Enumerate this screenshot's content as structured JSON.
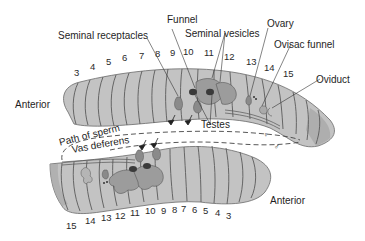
{
  "colors": {
    "body_fill": "#c3c3c3",
    "body_shade": "#a9a9a9",
    "segment_line": "#5a5a5a",
    "organ_fill": "#9c9c9c",
    "organ_dark": "#3a3a3a",
    "text": "#1e1e1e",
    "background": "#ffffff"
  },
  "labels": {
    "funnel": "Funnel",
    "seminal_receptacles": "Seminal receptacles",
    "seminal_vesicles": "Seminal vesicles",
    "ovary": "Ovary",
    "ovisac_funnel": "Ovisac funnel",
    "oviduct": "Oviduct",
    "testes": "Testes",
    "path_of_sperm": "Path of sperm",
    "vas_deferens": "Vas deferens",
    "anterior_top": "Anterior",
    "anterior_bottom": "Anterior",
    "female_symbol": "♀",
    "male_symbol": "♂"
  },
  "upper_worm_segments": [
    {
      "n": "3",
      "x": 74,
      "y": 68
    },
    {
      "n": "4",
      "x": 90,
      "y": 62
    },
    {
      "n": "5",
      "x": 106,
      "y": 57
    },
    {
      "n": "6",
      "x": 122,
      "y": 53
    },
    {
      "n": "7",
      "x": 139,
      "y": 51
    },
    {
      "n": "8",
      "x": 155,
      "y": 49
    },
    {
      "n": "9",
      "x": 170,
      "y": 48
    },
    {
      "n": "10",
      "x": 183,
      "y": 47
    },
    {
      "n": "11",
      "x": 204,
      "y": 48
    },
    {
      "n": "12",
      "x": 224,
      "y": 52
    },
    {
      "n": "13",
      "x": 246,
      "y": 57
    },
    {
      "n": "14",
      "x": 264,
      "y": 63
    },
    {
      "n": "15",
      "x": 283,
      "y": 69
    }
  ],
  "lower_worm_segments": [
    {
      "n": "15",
      "x": 66,
      "y": 221
    },
    {
      "n": "14",
      "x": 85,
      "y": 216
    },
    {
      "n": "13",
      "x": 101,
      "y": 213
    },
    {
      "n": "12",
      "x": 115,
      "y": 211
    },
    {
      "n": "11",
      "x": 130,
      "y": 208
    },
    {
      "n": "10",
      "x": 145,
      "y": 206
    },
    {
      "n": "9",
      "x": 161,
      "y": 206
    },
    {
      "n": "8",
      "x": 172,
      "y": 205
    },
    {
      "n": "7",
      "x": 181,
      "y": 204
    },
    {
      "n": "6",
      "x": 192,
      "y": 205
    },
    {
      "n": "5",
      "x": 203,
      "y": 206
    },
    {
      "n": "4",
      "x": 215,
      "y": 208
    },
    {
      "n": "3",
      "x": 226,
      "y": 211
    }
  ]
}
